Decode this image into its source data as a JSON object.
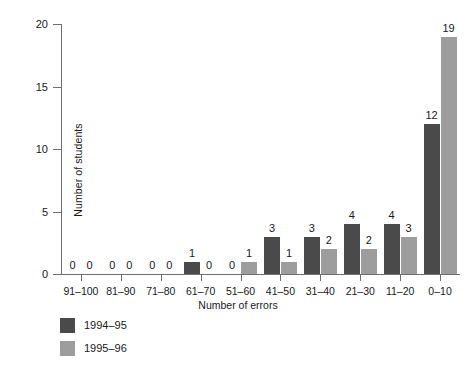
{
  "chart_data": {
    "type": "bar",
    "title": "",
    "xlabel": "Number of errors",
    "ylabel": "Number of students",
    "categories": [
      "91-100",
      "81-90",
      "71-80",
      "61-70",
      "51-60",
      "41-50",
      "31-40",
      "21-30",
      "11-20",
      "0-10"
    ],
    "series": [
      {
        "name": "1994-95",
        "color": "#4a4a4a",
        "values": [
          0,
          0,
          0,
          1,
          0,
          3,
          3,
          4,
          4,
          12
        ]
      },
      {
        "name": "1995-96",
        "color": "#9d9d9d",
        "values": [
          0,
          0,
          0,
          0,
          1,
          1,
          2,
          2,
          3,
          19
        ]
      }
    ],
    "ylim": [
      0,
      20
    ],
    "yticks": [
      0,
      5,
      10,
      15,
      20
    ],
    "ytick_labels": [
      "0",
      "5",
      "10",
      "15",
      "20"
    ],
    "grid": false,
    "legend_position": "below-left",
    "data_labels": true
  },
  "axes": {
    "y_title": "Number of students",
    "x_title": "Number of errors"
  },
  "legend": {
    "entries": [
      {
        "label": "1994-95",
        "swatch": "#4a4a4a"
      },
      {
        "label": "1995-96",
        "swatch": "#9d9d9d"
      }
    ]
  },
  "caption": {
    "text": ""
  }
}
